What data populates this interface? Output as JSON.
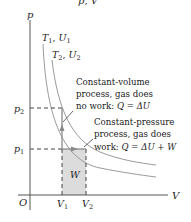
{
  "diagram": {
    "title_partial": "p, V",
    "axes": {
      "y_label": "p",
      "x_label": "V",
      "origin_label": "O"
    },
    "isotherms": [
      {
        "label_T": "T",
        "label_T_sub": "1",
        "label_U": "U",
        "label_U_sub": "1",
        "text": "T1, U1"
      },
      {
        "label_T": "T",
        "label_T_sub": "2",
        "label_U": "U",
        "label_U_sub": "2",
        "text": "T2, U2"
      }
    ],
    "pressure_ticks": [
      {
        "symbol": "p",
        "sub": "2",
        "text": "p2"
      },
      {
        "symbol": "p",
        "sub": "1",
        "text": "p1"
      }
    ],
    "volume_ticks": [
      {
        "symbol": "V",
        "sub": "1",
        "text": "V1"
      },
      {
        "symbol": "V",
        "sub": "2",
        "text": "V2"
      }
    ],
    "work_area_label": "W",
    "annotations": {
      "constant_volume": {
        "line1": "Constant-volume",
        "line2": "process, gas does",
        "line3_prefix": "no work: ",
        "line3_eq": "Q = ΔU"
      },
      "constant_pressure": {
        "line1": "Constant-pressure",
        "line2": "process, gas does",
        "line3_prefix": "work: ",
        "line3_eq": "Q = ΔU + W"
      }
    },
    "colors": {
      "axis": "#555555",
      "curve": "#9a9a9a",
      "dashed": "#444444",
      "arrow": "#8a8a8a",
      "shade": "#dcdcdc",
      "text": "#222222"
    }
  }
}
